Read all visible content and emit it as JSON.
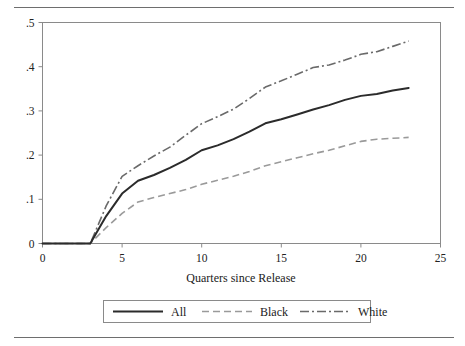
{
  "figure": {
    "rule_top_name": "top-divider",
    "rule_bottom_name": "bottom-divider"
  },
  "chart_data": {
    "type": "line",
    "title": "",
    "xlabel": "Quarters since Release",
    "ylabel": "",
    "xlim": [
      0,
      25
    ],
    "ylim": [
      0,
      0.5
    ],
    "grid": false,
    "legend_position": "bottom",
    "xticks": [
      0,
      5,
      10,
      15,
      20,
      25
    ],
    "xtick_labels": [
      "0",
      "5",
      "10",
      "15",
      "20",
      "25"
    ],
    "yticks": [
      0,
      0.1,
      0.2,
      0.3,
      0.4,
      0.5
    ],
    "ytick_labels": [
      "0",
      ".1",
      ".2",
      ".3",
      ".4",
      ".5"
    ],
    "x": [
      0,
      1,
      2,
      3,
      4,
      5,
      6,
      7,
      8,
      9,
      10,
      11,
      12,
      13,
      14,
      15,
      16,
      17,
      18,
      19,
      20,
      21,
      22,
      23
    ],
    "series": [
      {
        "name": "All",
        "style": "solid",
        "color": "#2b2b2b",
        "values": [
          0,
          0,
          0,
          0,
          0.062,
          0.113,
          0.142,
          0.155,
          0.171,
          0.189,
          0.211,
          0.222,
          0.236,
          0.253,
          0.272,
          0.281,
          0.292,
          0.303,
          0.313,
          0.325,
          0.334,
          0.338,
          0.346,
          0.352
        ]
      },
      {
        "name": "Black",
        "style": "dashed",
        "color": "#9a9a9a",
        "values": [
          0,
          0,
          0,
          0,
          0.036,
          0.068,
          0.094,
          0.104,
          0.113,
          0.122,
          0.134,
          0.143,
          0.152,
          0.163,
          0.176,
          0.185,
          0.194,
          0.203,
          0.211,
          0.221,
          0.231,
          0.236,
          0.238,
          0.24
        ]
      },
      {
        "name": "White",
        "style": "dash-dot",
        "color": "#6a6a6a",
        "values": [
          0,
          0,
          0,
          0,
          0.085,
          0.152,
          0.176,
          0.198,
          0.218,
          0.245,
          0.271,
          0.287,
          0.304,
          0.328,
          0.354,
          0.368,
          0.383,
          0.398,
          0.404,
          0.415,
          0.428,
          0.434,
          0.446,
          0.458
        ]
      }
    ],
    "legend_entries": [
      {
        "label": "All",
        "style": "solid"
      },
      {
        "label": "Black",
        "style": "dashed"
      },
      {
        "label": "White",
        "style": "dash-dot"
      }
    ]
  }
}
